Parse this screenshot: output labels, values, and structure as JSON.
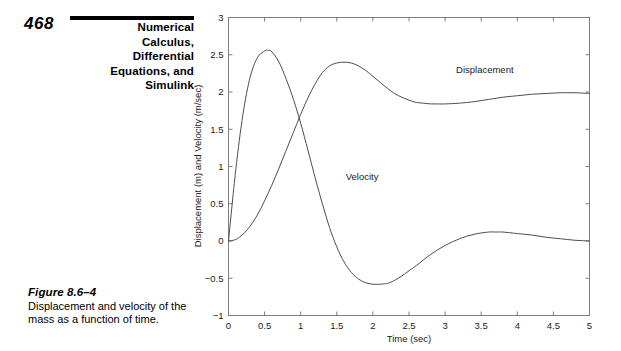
{
  "page": {
    "number": "468",
    "running_head_lines": [
      "Numerical",
      "Calculus,",
      "Differential",
      "Equations, and",
      "Simulink"
    ]
  },
  "figure": {
    "number_label": "Figure 8.6–4",
    "caption": "Displacement and velocity of the mass as a function of time."
  },
  "chart_data": {
    "type": "line",
    "title": "",
    "xlabel": "Time (sec)",
    "ylabel": "Displacement (m) and Velocity (m/sec)",
    "xlim": [
      0,
      5
    ],
    "ylim": [
      -1,
      3
    ],
    "xticks": [
      0,
      0.5,
      1,
      1.5,
      2,
      2.5,
      3,
      3.5,
      4,
      4.5,
      5
    ],
    "xticklabels": [
      "0",
      "0.5",
      "1",
      "1.5",
      "2",
      "2.5",
      "3",
      "3.5",
      "4",
      "4.5",
      "5"
    ],
    "yticks": [
      -1,
      -0.5,
      0,
      0.5,
      1,
      1.5,
      2,
      2.5,
      3
    ],
    "yticklabels": [
      "−1",
      "−0.5",
      "0",
      "0.5",
      "1",
      "1.5",
      "2",
      "2.5",
      "3"
    ],
    "grid": false,
    "legend": "inline-annotations",
    "annotations": [
      {
        "text": "Displacement",
        "x": 3.55,
        "y": 2.25
      },
      {
        "text": "Velocity",
        "x": 1.85,
        "y": 0.82
      }
    ],
    "series": [
      {
        "name": "Displacement",
        "unit": "m",
        "x": [
          0,
          0.1,
          0.2,
          0.3,
          0.4,
          0.5,
          0.6,
          0.7,
          0.8,
          0.9,
          1.0,
          1.1,
          1.2,
          1.3,
          1.4,
          1.5,
          1.6,
          1.7,
          1.8,
          1.9,
          2.0,
          2.1,
          2.2,
          2.3,
          2.4,
          2.5,
          2.6,
          2.7,
          2.8,
          2.9,
          3.0,
          3.2,
          3.4,
          3.6,
          3.8,
          4.0,
          4.2,
          4.4,
          4.6,
          4.8,
          5.0
        ],
        "y": [
          0,
          0.02,
          0.09,
          0.2,
          0.35,
          0.54,
          0.75,
          0.98,
          1.22,
          1.46,
          1.7,
          1.92,
          2.11,
          2.26,
          2.35,
          2.39,
          2.4,
          2.39,
          2.35,
          2.29,
          2.21,
          2.13,
          2.05,
          1.98,
          1.93,
          1.89,
          1.86,
          1.85,
          1.84,
          1.84,
          1.84,
          1.85,
          1.87,
          1.9,
          1.93,
          1.95,
          1.97,
          1.98,
          1.99,
          1.99,
          1.98
        ]
      },
      {
        "name": "Velocity",
        "unit": "m/sec",
        "x": [
          0,
          0.1,
          0.2,
          0.3,
          0.4,
          0.5,
          0.55,
          0.6,
          0.7,
          0.8,
          0.9,
          1.0,
          1.1,
          1.2,
          1.3,
          1.4,
          1.5,
          1.6,
          1.7,
          1.8,
          1.9,
          2.0,
          2.1,
          2.15,
          2.2,
          2.3,
          2.4,
          2.5,
          2.6,
          2.8,
          3.0,
          3.2,
          3.4,
          3.6,
          3.7,
          3.8,
          4.0,
          4.2,
          4.4,
          4.6,
          4.8,
          5.0
        ],
        "y": [
          0,
          0.95,
          1.7,
          2.2,
          2.46,
          2.55,
          2.56,
          2.54,
          2.4,
          2.17,
          1.9,
          1.58,
          1.22,
          0.85,
          0.5,
          0.18,
          -0.08,
          -0.28,
          -0.42,
          -0.51,
          -0.56,
          -0.58,
          -0.58,
          -0.575,
          -0.57,
          -0.53,
          -0.47,
          -0.4,
          -0.33,
          -0.18,
          -0.06,
          0.03,
          0.09,
          0.12,
          0.12,
          0.12,
          0.1,
          0.08,
          0.05,
          0.03,
          0.01,
          0.0
        ]
      }
    ],
    "key_points": {
      "velocity_peak": {
        "t": 0.55,
        "value": 2.56
      },
      "velocity_min": {
        "t": 2.15,
        "value": -0.575
      },
      "velocity_secondary_peak": {
        "t": 3.7,
        "value": 0.12
      },
      "displacement_peak": {
        "t": 1.6,
        "value": 2.4
      },
      "displacement_steady_state": 2.0,
      "curve_crossing": {
        "t": 0.95,
        "value": 1.85
      }
    }
  }
}
